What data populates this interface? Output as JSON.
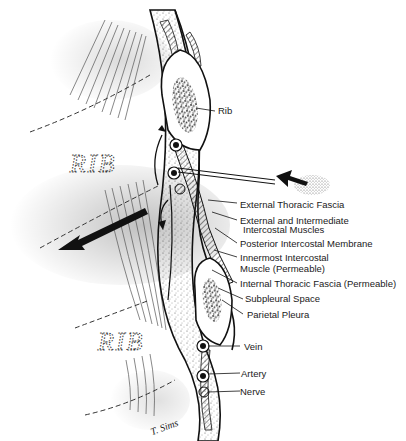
{
  "diagram": {
    "type": "anatomical-cross-section",
    "background_labels": {
      "upper_rib": "RIB",
      "lower_rib": "RIB"
    },
    "labels": [
      {
        "id": "rib",
        "text": "Rib"
      },
      {
        "id": "external-thoracic-fascia",
        "text": "External Thoracic Fascia"
      },
      {
        "id": "external-intermediate-intercostal-1",
        "text": "External and Intermediate"
      },
      {
        "id": "external-intermediate-intercostal-2",
        "text": "Intercostal Muscles"
      },
      {
        "id": "posterior-intercostal-membrane",
        "text": "Posterior Intercostal Membrane"
      },
      {
        "id": "innermost-intercostal-1",
        "text": "Innermost Intercostal"
      },
      {
        "id": "innermost-intercostal-2",
        "text": "Muscle (Permeable)"
      },
      {
        "id": "internal-thoracic-fascia",
        "text": "Internal Thoracic Fascia (Permeable)"
      },
      {
        "id": "subpleural-space",
        "text": "Subpleural Space"
      },
      {
        "id": "parietal-pleura",
        "text": "Parietal Pleura"
      },
      {
        "id": "vein",
        "text": "Vein"
      },
      {
        "id": "artery",
        "text": "Artery"
      },
      {
        "id": "nerve",
        "text": "Nerve"
      }
    ],
    "signature": "T. Sims",
    "colors": {
      "ink": "#1a1a1a",
      "background": "#ffffff"
    }
  }
}
